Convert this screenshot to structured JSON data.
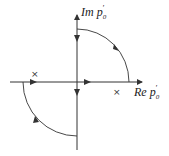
{
  "diagram": {
    "axes": {
      "imag_label": "Im p",
      "imag_sub": "0",
      "imag_prime": "′",
      "real_label": "Re p",
      "real_sub": "0",
      "real_prime": "′"
    },
    "poles": [
      {
        "symbol": "×",
        "position": "upper-left, just above real axis"
      },
      {
        "symbol": "×",
        "position": "lower-right, just below real axis"
      }
    ],
    "contour": {
      "segments": [
        "upper quarter arc from positive imaginary axis to positive real axis (clockwise arrow)",
        "along real axis rightward",
        "along imaginary axis downward",
        "lower quarter arc from negative real axis to negative imaginary axis (counterclockwise arrow)"
      ]
    },
    "colors": {
      "line": "#333333",
      "background": "#ffffff"
    }
  }
}
